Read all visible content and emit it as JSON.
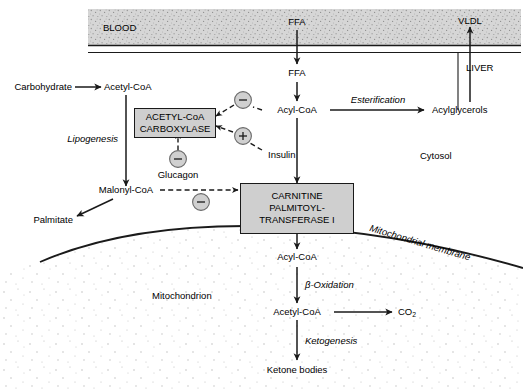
{
  "compartments": {
    "blood": "BLOOD",
    "liver": "LIVER",
    "cytosol": "Cytosol",
    "mitochondrion": "Mitochondrion",
    "mitochondrial_membrane": "Mitochondrial membrane"
  },
  "metabolites": {
    "carbohydrate": "Carbohydrate",
    "acetyl_coa_cytosol": "Acetyl-CoA",
    "ffa_blood": "FFA",
    "ffa_liver": "FFA",
    "vldl": "VLDL",
    "acyl_coa_cytosol": "Acyl-CoA",
    "acylglycerols": "Acylglycerols",
    "malonyl_coa": "Malonyl-CoA",
    "palmitate": "Palmitate",
    "acyl_coa_mito": "Acyl-CoA",
    "acetyl_coa_mito": "Acetyl-CoA",
    "co2": "CO",
    "co2_sub": "2",
    "ketone_bodies": "Ketone bodies"
  },
  "enzymes": {
    "acc": {
      "line1": "ACETYL-CoA",
      "line2": "CARBOXYLASE"
    },
    "cpt1": {
      "line1": "CARNITINE",
      "line2": "PALMITOYL-",
      "line3": "TRANSFERASE I"
    }
  },
  "hormones": {
    "insulin": "Insulin",
    "glucagon": "Glucagon"
  },
  "processes": {
    "lipogenesis": "Lipogenesis",
    "esterification": "Esterification",
    "beta_oxidation": "β-Oxidation",
    "ketogenesis": "Ketogenesis"
  },
  "regulation": {
    "minus": "−",
    "plus": "+",
    "signs": [
      {
        "name": "insulin-inhibits-acc",
        "sign": "−"
      },
      {
        "name": "insulin-activates-acc",
        "sign": "+"
      },
      {
        "name": "glucagon-inhibits-acc",
        "sign": "−"
      },
      {
        "name": "malonyl-coa-inhibits-cpt1",
        "sign": "−"
      }
    ]
  },
  "colors": {
    "blood_band_fill": "#d4d4d4",
    "enzyme_box_fill": "#cfcfcf",
    "circle_fill": "#d0d0d0",
    "stroke": "#1a1a1a",
    "text": "#000000"
  }
}
